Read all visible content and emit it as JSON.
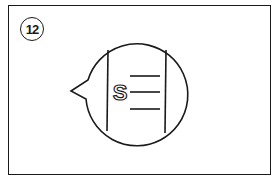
{
  "panel": {
    "step_number": "12",
    "illustration": {
      "description": "speech bubble containing a document with an S symbol and three text lines",
      "symbol": "S",
      "text_line_count": 3
    }
  },
  "colors": {
    "stroke": "#1a1a1a",
    "background": "#ffffff"
  }
}
